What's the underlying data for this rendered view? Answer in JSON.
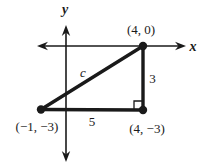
{
  "figure": {
    "background_color": "#ffffff",
    "ink_color": "#1a1a1a",
    "axes": {
      "x_label": "x",
      "y_label": "y"
    },
    "triangle": {
      "vertices": [
        {
          "id": "bottom-left",
          "coords": [
            -1,
            -3
          ],
          "label": "(−1, −3)"
        },
        {
          "id": "bottom-right",
          "coords": [
            4,
            -3
          ],
          "label": "(4, −3)"
        },
        {
          "id": "top-right",
          "coords": [
            4,
            0
          ],
          "label": "(4, 0)"
        }
      ],
      "side_labels": {
        "hypotenuse": "c",
        "vertical_leg": "3",
        "horizontal_leg": "5"
      },
      "right_angle_vertex": "bottom-right"
    }
  }
}
